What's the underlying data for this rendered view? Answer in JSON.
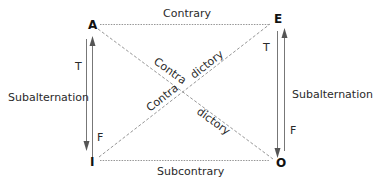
{
  "diagram": {
    "vertices": {
      "top_left": "A",
      "top_right": "E",
      "bottom_left": "I",
      "bottom_right": "O"
    },
    "relations": {
      "top": "Contrary",
      "bottom": "Subcontrary",
      "left": "Subalternation",
      "right": "Subalternation",
      "diagonal_1_part1": "Contra",
      "diagonal_1_part2": "dictory",
      "diagonal_2_part1": "Contra",
      "diagonal_2_part2": "dictory"
    },
    "truth_labels": {
      "left_top": "T",
      "left_bottom": "F",
      "right_top": "T",
      "right_bottom": "F"
    }
  }
}
